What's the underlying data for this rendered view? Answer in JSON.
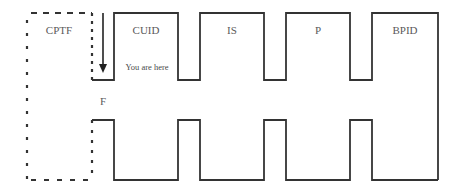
{
  "diagram": {
    "type": "process-flow",
    "stroke_color": "#333333",
    "dashed_box": {
      "label": "CPTF",
      "style": "dashed"
    },
    "segments": [
      {
        "id": "cuid",
        "label": "CUID"
      },
      {
        "id": "is",
        "label": "IS"
      },
      {
        "id": "p",
        "label": "P"
      },
      {
        "id": "bpid",
        "label": "BPID"
      }
    ],
    "marker": {
      "label": "You are here",
      "icon": "down-arrow-icon"
    },
    "gap_label": "F"
  }
}
